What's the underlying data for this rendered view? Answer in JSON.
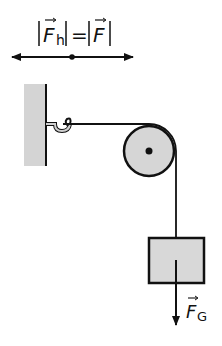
{
  "diagram": {
    "type": "physics-pulley",
    "equation": {
      "left_symbol": "F",
      "left_subscript": "h",
      "operator": "=",
      "right_symbol": "F",
      "text": "|F_h| = |F|"
    },
    "force_label": {
      "symbol": "F",
      "subscript": "G"
    },
    "components": [
      "wall",
      "hook",
      "rope",
      "fixed-pulley",
      "mass-block",
      "horizontal-force-arrow",
      "gravity-force-arrow"
    ],
    "colors": {
      "stroke": "#111111",
      "wall_fill": "#d4d4d4",
      "pulley_fill": "#d6d6d6",
      "block_fill": "#d8d8d8"
    }
  }
}
